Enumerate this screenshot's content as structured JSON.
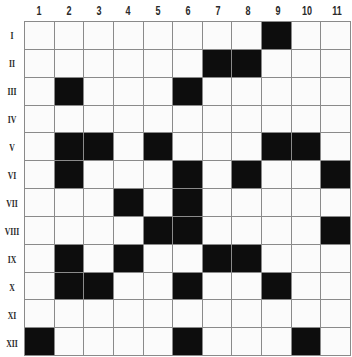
{
  "puzzle": {
    "columns": [
      "1",
      "2",
      "3",
      "4",
      "5",
      "6",
      "7",
      "8",
      "9",
      "10",
      "11"
    ],
    "rows": [
      "I",
      "II",
      "III",
      "IV",
      "V",
      "VI",
      "VII",
      "VIII",
      "IX",
      "X",
      "XI",
      "XII"
    ],
    "filled_color": "#0d0d0d",
    "empty_color": "#fbfbfb",
    "grid_line_color": "#8a8a8a",
    "filled_cells": {
      "I": [
        9
      ],
      "II": [
        7,
        8
      ],
      "III": [
        2,
        6
      ],
      "IV": [],
      "V": [
        2,
        3,
        5,
        9,
        10
      ],
      "VI": [
        2,
        6,
        8,
        11
      ],
      "VII": [
        4,
        6
      ],
      "VIII": [
        5,
        6,
        11
      ],
      "IX": [
        2,
        4,
        7,
        8
      ],
      "X": [
        2,
        3,
        6,
        9
      ],
      "XI": [],
      "XII": [
        1,
        6,
        10
      ]
    }
  }
}
